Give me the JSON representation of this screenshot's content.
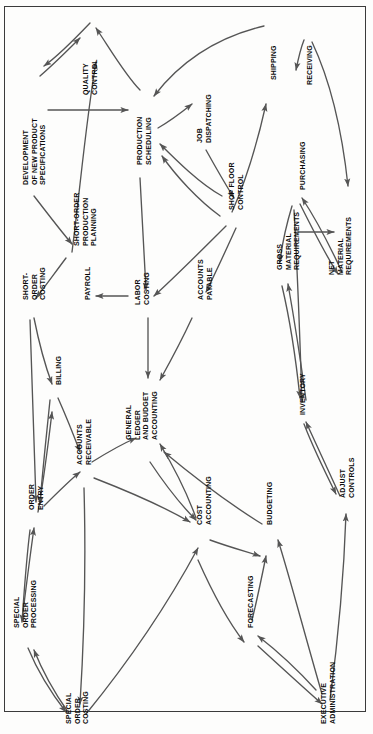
{
  "figure": {
    "type": "node-link-diagram",
    "orientation": "landscape-rotated",
    "border_color": "#3b3b3b",
    "line_color": "#555555",
    "text_color": "#0b0b0b",
    "background_color": "#fdfdfc"
  },
  "nodes": [
    {
      "id": "dev_new_product",
      "label": [
        "DEVELOPMENT",
        "OF NEW PRODUCT",
        "SPECIFICATIONS"
      ],
      "x": 22,
      "y": 185
    },
    {
      "id": "quality_control",
      "label": [
        "QUALITY",
        "CONTROL"
      ],
      "x": 82,
      "y": 95
    },
    {
      "id": "short_order_plan",
      "label": [
        "SHORT-ORDER",
        "PRODUCTION",
        "PLANNING"
      ],
      "x": 73,
      "y": 246
    },
    {
      "id": "production_sched",
      "label": [
        "PRODUCTION",
        "SCHEDULING"
      ],
      "x": 136,
      "y": 165
    },
    {
      "id": "job_dispatching",
      "label": [
        "JOB",
        "DISPATCHING"
      ],
      "x": 196,
      "y": 143
    },
    {
      "id": "shipping",
      "label": [
        "SHIPPING"
      ],
      "x": 270,
      "y": 80
    },
    {
      "id": "receiving",
      "label": [
        "RECEIVING"
      ],
      "x": 306,
      "y": 85
    },
    {
      "id": "purchasing",
      "label": [
        "PURCHASING"
      ],
      "x": 299,
      "y": 190
    },
    {
      "id": "shop_floor",
      "label": [
        "SHOP FLOOR",
        "CONTROL"
      ],
      "x": 228,
      "y": 210
    },
    {
      "id": "gross_material",
      "label": [
        "GROSS",
        "MATERIAL",
        "REQUIREMENTS"
      ],
      "x": 276,
      "y": 270
    },
    {
      "id": "net_material",
      "label": [
        "NET",
        "MATERIAL",
        "REQUIREMENTS"
      ],
      "x": 328,
      "y": 275
    },
    {
      "id": "short_order_cost",
      "label": [
        "SHORT-",
        "ORDER",
        "COSTING"
      ],
      "x": 22,
      "y": 300
    },
    {
      "id": "payroll",
      "label": [
        "PAYROLL"
      ],
      "x": 84,
      "y": 300
    },
    {
      "id": "labor_costing",
      "label": [
        "LABOR",
        "COSTING"
      ],
      "x": 134,
      "y": 305
    },
    {
      "id": "accounts_payable",
      "label": [
        "ACCOUNTS",
        "PAYABLE"
      ],
      "x": 197,
      "y": 300
    },
    {
      "id": "billing",
      "label": [
        "BILLING"
      ],
      "x": 55,
      "y": 385
    },
    {
      "id": "accounts_recv",
      "label": [
        "ACCOUNTS",
        "RECEIVABLE"
      ],
      "x": 76,
      "y": 465
    },
    {
      "id": "general_ledger",
      "label": [
        "GENERAL",
        "LEDGER",
        "AND BUDGET",
        "ACCOUNTING"
      ],
      "x": 125,
      "y": 440
    },
    {
      "id": "inventory",
      "label": [
        "INVENTORY"
      ],
      "x": 299,
      "y": 415
    },
    {
      "id": "order_entry",
      "label": [
        "ORDER",
        "ENTRY"
      ],
      "x": 28,
      "y": 510
    },
    {
      "id": "cost_accounting",
      "label": [
        "COST",
        "ACCOUNTING"
      ],
      "x": 196,
      "y": 525
    },
    {
      "id": "budgeting",
      "label": [
        "BUDGETING"
      ],
      "x": 266,
      "y": 525
    },
    {
      "id": "adjust_controls",
      "label": [
        "ADJUST",
        "CONTROLS"
      ],
      "x": 339,
      "y": 498
    },
    {
      "id": "forecasting",
      "label": [
        "FORECASTING"
      ],
      "x": 247,
      "y": 628
    },
    {
      "id": "special_order_proc",
      "label": [
        "SPECIAL",
        "ORDER",
        "PROCESSING"
      ],
      "x": 13,
      "y": 628
    },
    {
      "id": "special_order_cost",
      "label": [
        "SPECIAL",
        "ORDER",
        "COSTING"
      ],
      "x": 65,
      "y": 724
    },
    {
      "id": "exec_admin",
      "label": [
        "EXECUTIVE",
        "ADMINISTRATION"
      ],
      "x": 320,
      "y": 724
    }
  ],
  "edges": [
    {
      "from": "dev_new_product",
      "to": "production_sched",
      "d": "M 48 110 L 128 110"
    },
    {
      "from": "quality_control",
      "to": "dev_new_product",
      "d": "M 90 23 C 70 44 58 56 44 66"
    },
    {
      "from": "dev_new_product",
      "to": "quality_control",
      "d": "M 40 76 C 54 64 66 52 80 38"
    },
    {
      "from": "short_order_plan",
      "to": "quality_control",
      "d": "M 72 252 C 80 190 86 120 96 62"
    },
    {
      "from": "production_sched",
      "to": "quality_control",
      "d": "M 140 90 C 126 76 112 52 96 28"
    },
    {
      "from": "shipping",
      "to": "production_sched",
      "d": "M 264 26 C 214 38 180 62 154 96"
    },
    {
      "from": "production_sched",
      "to": "job_dispatching",
      "d": "M 158 128 C 172 120 182 112 192 104"
    },
    {
      "from": "job_dispatching",
      "to": "shop_floor",
      "d": "M 206 150 C 216 168 224 182 234 198"
    },
    {
      "from": "shop_floor",
      "to": "production_sched",
      "d": "M 222 196 C 200 184 176 160 160 144"
    },
    {
      "from": "shop_floor",
      "to": "shipping",
      "d": "M 232 212 C 248 176 258 140 266 104"
    },
    {
      "from": "shop_floor",
      "to": "production_sched",
      "d": "M 220 216 C 198 200 176 176 162 156"
    },
    {
      "from": "receiving",
      "to": "purchasing",
      "d": "M 304 40 C 300 50 298 60 296 70"
    },
    {
      "from": "receiving",
      "to": "net_material",
      "d": "M 312 42 C 330 80 342 130 348 186"
    },
    {
      "from": "purchasing",
      "to": "gross_material",
      "d": "M 292 206 C 286 226 282 244 280 262"
    },
    {
      "from": "gross_material",
      "to": "net_material",
      "d": "M 298 232 L 334 232"
    },
    {
      "from": "purchasing",
      "to": "inventory",
      "d": "M 294 210 C 298 280 300 340 302 402"
    },
    {
      "from": "net_material",
      "to": "purchasing",
      "d": "M 342 272 C 328 242 314 216 302 198"
    },
    {
      "from": "gross_material",
      "to": "inventory",
      "d": "M 282 286 C 290 320 296 360 300 398"
    },
    {
      "from": "inventory",
      "to": "gross_material",
      "d": "M 306 400 C 300 356 294 318 288 284"
    },
    {
      "from": "labor_costing",
      "to": "payroll",
      "d": "M 128 296 L 96 296"
    },
    {
      "from": "labor_costing",
      "to": "general_ledger",
      "d": "M 148 318 L 148 378"
    },
    {
      "from": "accounts_payable",
      "to": "general_ledger",
      "d": "M 192 318 C 180 344 170 362 160 380"
    },
    {
      "from": "short_order_cost",
      "to": "billing",
      "d": "M 34 318 C 40 348 46 368 52 384"
    },
    {
      "from": "billing",
      "to": "accounts_recv",
      "d": "M 58 398 C 66 416 74 436 80 452"
    },
    {
      "from": "order_entry",
      "to": "billing",
      "d": "M 38 512 C 44 478 48 446 52 412"
    },
    {
      "from": "order_entry",
      "to": "accounts_recv",
      "d": "M 44 506 C 58 492 70 480 80 472"
    },
    {
      "from": "accounts_recv",
      "to": "general_ledger",
      "d": "M 92 462 C 108 452 122 444 136 438"
    },
    {
      "from": "accounts_recv",
      "to": "cost_accounting",
      "d": "M 94 478 C 130 492 166 508 190 522"
    },
    {
      "from": "cost_accounting",
      "to": "general_ledger",
      "d": "M 196 518 C 186 490 172 464 160 444"
    },
    {
      "from": "cost_accounting",
      "to": "budgeting",
      "d": "M 210 540 C 232 548 248 552 260 556"
    },
    {
      "from": "forecasting",
      "to": "budgeting",
      "d": "M 252 620 C 258 596 262 576 266 556"
    },
    {
      "from": "budgeting",
      "to": "general_ledger",
      "d": "M 262 524 C 220 498 188 472 164 452"
    },
    {
      "from": "exec_admin",
      "to": "adjust_controls",
      "d": "M 330 700 C 338 640 344 572 346 514"
    },
    {
      "from": "exec_admin",
      "to": "budgeting",
      "d": "M 322 694 C 304 632 290 578 278 540"
    },
    {
      "from": "exec_admin",
      "to": "forecasting",
      "d": "M 316 690 C 296 668 276 650 258 636"
    },
    {
      "from": "adjust_controls",
      "to": "inventory",
      "d": "M 340 496 C 328 470 316 444 306 422"
    },
    {
      "from": "special_order_proc",
      "to": "order_entry",
      "d": "M 22 620 C 26 588 30 556 34 528"
    },
    {
      "from": "order_entry",
      "to": "special_order_proc",
      "d": "M 30 530 C 26 562 24 594 22 622"
    },
    {
      "from": "special_order_cost",
      "to": "special_order_proc",
      "d": "M 68 712 C 54 692 42 670 34 650"
    },
    {
      "from": "special_order_proc",
      "to": "special_order_cost",
      "d": "M 28 648 C 38 672 52 694 66 712"
    },
    {
      "from": "accounts_recv",
      "to": "special_order_cost",
      "d": "M 84 488 C 86 560 84 640 80 704"
    },
    {
      "from": "special_order_cost",
      "to": "cost_accounting",
      "d": "M 86 714 C 130 660 170 600 198 548"
    },
    {
      "from": "cost_accounting",
      "to": "forecasting",
      "d": "M 198 560 C 214 596 230 624 244 642"
    },
    {
      "from": "forecasting",
      "to": "exec_admin",
      "d": "M 258 646 C 282 668 304 688 322 704"
    },
    {
      "from": "general_ledger",
      "to": "cost_accounting",
      "d": "M 150 462 C 166 486 182 506 196 520"
    },
    {
      "from": "short_order_plan",
      "to": "short_order_cost",
      "d": "M 66 258 C 54 274 44 288 36 298"
    },
    {
      "from": "production_sched",
      "to": "labor_costing",
      "d": "M 140 178 C 142 216 144 252 146 290"
    },
    {
      "from": "shop_floor",
      "to": "labor_costing",
      "d": "M 226 226 C 200 252 176 276 154 296"
    },
    {
      "from": "shop_floor",
      "to": "accounts_payable",
      "d": "M 236 228 C 226 250 216 272 206 292"
    },
    {
      "from": "dev_new_product",
      "to": "short_order_plan",
      "d": "M 34 196 C 48 214 60 230 72 244"
    },
    {
      "from": "short_order_cost",
      "to": "order_entry",
      "d": "M 30 320 C 32 384 34 448 36 502"
    },
    {
      "from": "billing",
      "to": "order_entry",
      "d": "M 50 400 C 46 440 42 476 40 504"
    },
    {
      "from": "purchasing",
      "to": "net_material",
      "d": "M 300 204 C 314 232 326 256 338 274"
    },
    {
      "from": "inventory",
      "to": "adjust_controls",
      "d": "M 304 424 C 314 450 326 474 336 494"
    }
  ]
}
